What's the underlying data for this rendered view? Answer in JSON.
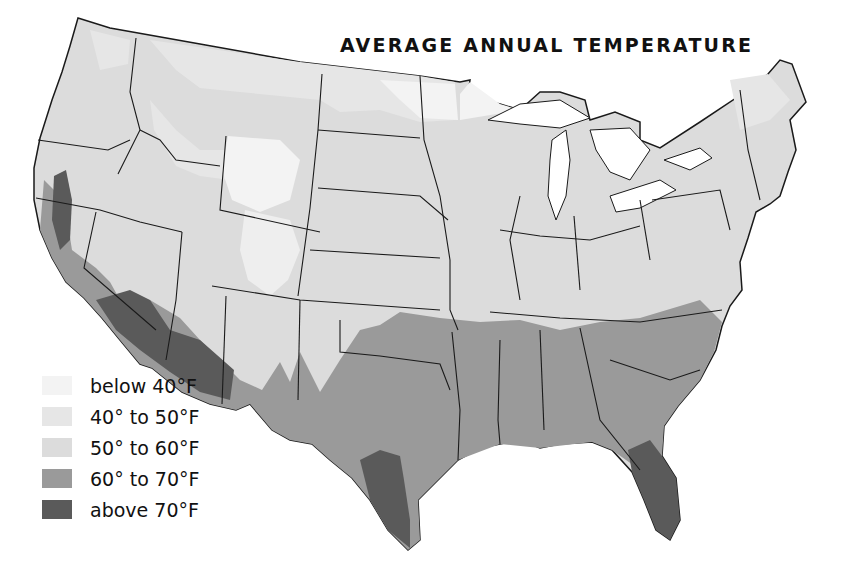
{
  "map": {
    "title": "AVERAGE ANNUAL TEMPERATURE",
    "region": "Contiguous United States",
    "legend": [
      {
        "key": "below_40",
        "label": "below 40°F",
        "color": "#f3f3f3"
      },
      {
        "key": "40_50",
        "label": "40° to 50°F",
        "color": "#e6e6e6"
      },
      {
        "key": "50_60",
        "label": "50° to 60°F",
        "color": "#dcdcdc"
      },
      {
        "key": "60_70",
        "label": "60° to 70°F",
        "color": "#9a9a9a"
      },
      {
        "key": "above_70",
        "label": "above 70°F",
        "color": "#5a5a5a"
      }
    ],
    "colors": {
      "background": "#ffffff",
      "border": "#1a1a1a",
      "text": "#111111"
    }
  }
}
